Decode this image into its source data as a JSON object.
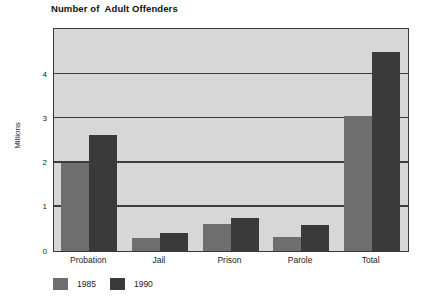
{
  "chart_data": {
    "type": "bar",
    "title": "Number of  Adult Offenders",
    "xlabel": "",
    "ylabel": "Millions",
    "ylim": [
      0,
      5
    ],
    "yticks": [
      0,
      1,
      2,
      3,
      4
    ],
    "ytick_labels": [
      "0",
      "1",
      "2",
      "3",
      "4"
    ],
    "grid": true,
    "grid_axis": "y",
    "legend_position": "bottom-left",
    "categories": [
      "Probation",
      "Jail",
      "Prison",
      "Parole",
      "Total"
    ],
    "series": [
      {
        "name": "1985",
        "color": "#6e6e6e",
        "values": [
          2.0,
          0.29,
          0.61,
          0.31,
          3.05
        ]
      },
      {
        "name": "1990",
        "color": "#3a3a3a",
        "values": [
          2.62,
          0.41,
          0.74,
          0.58,
          4.5
        ]
      }
    ]
  },
  "colors": {
    "plot_background": "#d7d7d7",
    "axis": "#3a3a3a",
    "gridline": "#3d3d3d",
    "text": "#1a1a1a",
    "series_1985": "#6e6e6e",
    "series_1990": "#3a3a3a"
  }
}
